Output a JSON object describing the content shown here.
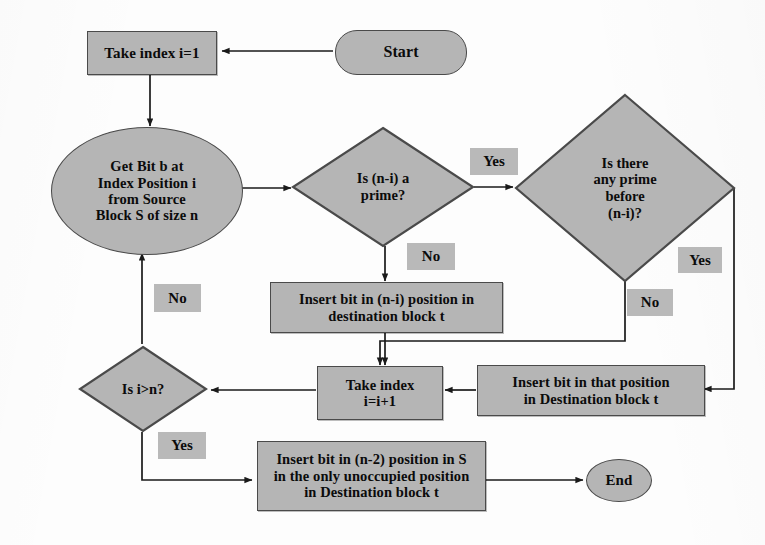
{
  "diagram": {
    "colors": {
      "node_fill": "#b5b5b5",
      "node_stroke": "#4a4a4a",
      "label_fill": "#b9b9b9",
      "text": "#0b0b0b",
      "edge": "#1a1a1a",
      "background": "#fdfdfd"
    },
    "nodes": {
      "start": {
        "label": "Start",
        "shape": "terminator"
      },
      "take_index_1": {
        "label": "Take index i=1",
        "shape": "process"
      },
      "get_bit": {
        "label": "Get Bit b at\nIndex Position i\nfrom  Source\nBlock S of size n",
        "shape": "ellipse"
      },
      "is_prime": {
        "label": "Is (n-i)  a\nprime?",
        "shape": "decision"
      },
      "any_prime_before": {
        "label": "Is there\nany prime\nbefore\n(n-i)?",
        "shape": "decision"
      },
      "insert_ni": {
        "label": "Insert bit in (n-i) position in\ndestination block t",
        "shape": "process"
      },
      "insert_that_pos": {
        "label": "Insert bit in that position\nin Destination block t",
        "shape": "process"
      },
      "take_index_inc": {
        "label": "Take index\ni=i+1",
        "shape": "process"
      },
      "is_i_gt_n": {
        "label": "Is i>n?",
        "shape": "decision"
      },
      "insert_n2": {
        "label": "Insert bit in (n-2) position in  S\nin the only unoccupied position\nin Destination block t",
        "shape": "process"
      },
      "end": {
        "label": "End",
        "shape": "ellipse"
      }
    },
    "edge_labels": {
      "is_prime_yes": "Yes",
      "is_prime_no": "No",
      "any_prime_yes": "Yes",
      "any_prime_no": "No",
      "is_i_gt_n_no": "No",
      "is_i_gt_n_yes": "Yes"
    },
    "edges": [
      {
        "from": "start",
        "to": "take_index_1",
        "label": ""
      },
      {
        "from": "take_index_1",
        "to": "get_bit",
        "label": ""
      },
      {
        "from": "get_bit",
        "to": "is_prime",
        "label": ""
      },
      {
        "from": "is_prime",
        "to": "any_prime_before",
        "label": "Yes"
      },
      {
        "from": "is_prime",
        "to": "insert_ni",
        "label": "No"
      },
      {
        "from": "any_prime_before",
        "to": "insert_that_pos",
        "label": "Yes"
      },
      {
        "from": "any_prime_before",
        "to": "take_index_inc",
        "label": "No"
      },
      {
        "from": "insert_ni",
        "to": "take_index_inc",
        "label": ""
      },
      {
        "from": "insert_that_pos",
        "to": "take_index_inc",
        "label": ""
      },
      {
        "from": "take_index_inc",
        "to": "is_i_gt_n",
        "label": ""
      },
      {
        "from": "is_i_gt_n",
        "to": "get_bit",
        "label": "No"
      },
      {
        "from": "is_i_gt_n",
        "to": "insert_n2",
        "label": "Yes"
      },
      {
        "from": "insert_n2",
        "to": "end",
        "label": ""
      }
    ]
  }
}
